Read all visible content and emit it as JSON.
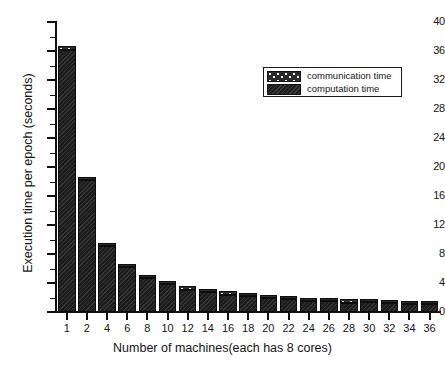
{
  "chart_data": {
    "type": "bar",
    "title": "",
    "xlabel": "Number of machines(each has 8 cores)",
    "ylabel": "Execution time per epoch (seconds)",
    "ylim": [
      0,
      40
    ],
    "ytick_values": [
      0,
      4,
      8,
      12,
      16,
      20,
      24,
      28,
      32,
      36,
      40
    ],
    "ytick_labels": [
      "0",
      "4",
      "8",
      "12",
      "16",
      "20",
      "24",
      "28",
      "32",
      "36",
      "40"
    ],
    "grid": false,
    "stacked": true,
    "legend_position": "upper right",
    "categories": [
      "1",
      "2",
      "4",
      "6",
      "8",
      "10",
      "12",
      "14",
      "16",
      "18",
      "20",
      "22",
      "24",
      "26",
      "28",
      "30",
      "32",
      "34",
      "36"
    ],
    "series": [
      {
        "name": "computation time",
        "pattern": "dark-hatch",
        "color": "#1d1d1d",
        "values": [
          36.2,
          18.2,
          9.1,
          6.2,
          4.7,
          3.8,
          3.1,
          2.7,
          2.4,
          2.2,
          1.9,
          1.8,
          1.5,
          1.5,
          1.3,
          1.4,
          1.2,
          1.1,
          1.1
        ]
      },
      {
        "name": "communication time",
        "pattern": "speckled-dots",
        "color": "#2b2b2b",
        "values": [
          0.1,
          0.1,
          0.15,
          0.2,
          0.2,
          0.2,
          0.2,
          0.25,
          0.25,
          0.25,
          0.25,
          0.3,
          0.3,
          0.3,
          0.3,
          0.35,
          0.35,
          0.35,
          0.4
        ]
      }
    ],
    "totals": [
      36.3,
      18.3,
      9.25,
      6.4,
      4.9,
      4.0,
      3.3,
      2.95,
      2.65,
      2.45,
      2.15,
      2.1,
      1.8,
      1.8,
      1.6,
      1.75,
      1.55,
      1.45,
      1.5
    ]
  },
  "legend": {
    "entries": [
      {
        "label": "communication time",
        "swatch": "comm"
      },
      {
        "label": "computation time",
        "swatch": "comp"
      }
    ]
  }
}
